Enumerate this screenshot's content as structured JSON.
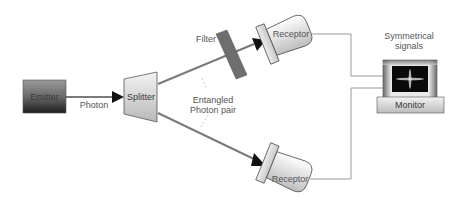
{
  "diagram": {
    "nodes": {
      "emitter": {
        "label": "Emitter"
      },
      "splitter": {
        "label": "Splitter"
      },
      "filter": {
        "label": "Filter"
      },
      "receptor_top": {
        "label": "Receptor"
      },
      "receptor_bottom": {
        "label": "Receptor"
      },
      "monitor": {
        "label": "Monitor"
      }
    },
    "edges": {
      "photon": {
        "label": "Photon",
        "from": "Emitter",
        "to": "Splitter"
      },
      "beam_top": {
        "from": "Splitter",
        "to": "Receptor",
        "via": "Filter"
      },
      "beam_bottom": {
        "from": "Splitter",
        "to": "Receptor"
      },
      "wire_top": {
        "from": "Receptor",
        "to": "Monitor"
      },
      "wire_bottom": {
        "from": "Receptor",
        "to": "Monitor"
      }
    },
    "annotations": {
      "entangled_line1": "Entangled",
      "entangled_line2": "Photon pair",
      "signals_line1": "Symmetrical",
      "signals_line2": "signals"
    },
    "colors": {
      "beam": "#7a7a7a",
      "wire": "#9a9a9a",
      "emitter_top": "#8a8a8a",
      "emitter_bottom": "#2a2a2a",
      "filter": "#6e6e6e",
      "screen": "#0a0a0a"
    }
  }
}
